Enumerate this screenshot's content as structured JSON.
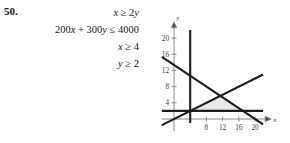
{
  "problem": {
    "number": "50.",
    "equations": [
      "x ≥ 2y",
      "200x + 300y ≤ 4000",
      "x ≥ 4",
      "y ≥ 2"
    ]
  },
  "chart_data": {
    "type": "line",
    "title": "",
    "xlabel": "x",
    "ylabel": "y",
    "xlim": [
      -3,
      23
    ],
    "ylim": [
      -3,
      23
    ],
    "grid": false,
    "legend": "none",
    "xticks": [
      8,
      12,
      16,
      20
    ],
    "xtick_labels": [
      "8",
      "12",
      "16",
      "20"
    ],
    "yticks": [
      4,
      8,
      12,
      16,
      20
    ],
    "ytick_labels": [
      "4",
      "8",
      "12",
      "16",
      "20"
    ],
    "series": [
      {
        "name": "x = 2y",
        "equation": "y = x/2",
        "x": [
          -3,
          22
        ],
        "y": [
          -1.5,
          11
        ]
      },
      {
        "name": "200x + 300y = 4000",
        "equation": "y = (4000 - 200x)/300",
        "x": [
          -3,
          22
        ],
        "y": [
          15.33,
          -1.33
        ]
      },
      {
        "name": "x = 4",
        "equation": "x = 4",
        "x": [
          4,
          4
        ],
        "y": [
          -1,
          22
        ]
      },
      {
        "name": "y = 2",
        "equation": "y = 2",
        "x": [
          -3,
          22
        ],
        "y": [
          2,
          2
        ]
      }
    ],
    "shaded_region": {
      "label": "feasible-region",
      "vertices": [
        [
          4,
          2
        ],
        [
          16,
          2
        ],
        [
          12,
          6
        ]
      ],
      "color": "#e8e8e8"
    },
    "colors": {
      "line": "#1c1c1c",
      "axis": "#8a8a8a",
      "region": "#e8e8e8"
    }
  },
  "axis_labels": {
    "x": "x",
    "y": "y"
  }
}
